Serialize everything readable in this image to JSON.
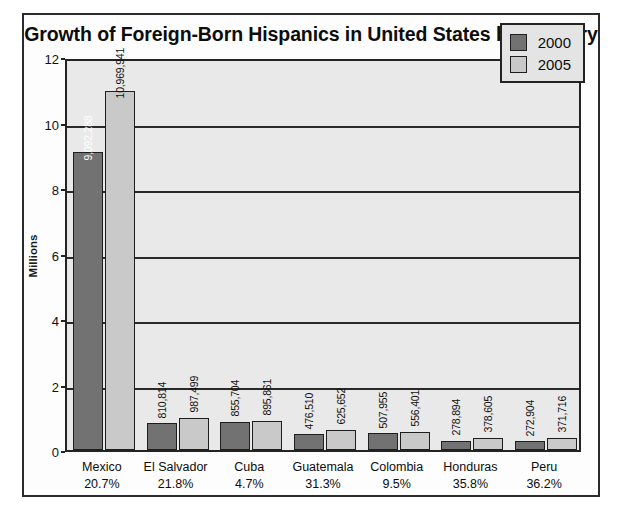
{
  "chart_data": {
    "type": "bar",
    "title": "Growth of Foreign-Born Hispanics in United States by Country",
    "xlabel": "",
    "ylabel": "Millions",
    "ylim": [
      0,
      12
    ],
    "yticks": [
      0,
      2,
      4,
      6,
      8,
      10,
      12
    ],
    "grid": true,
    "legend_position": "top-right",
    "categories": [
      "Mexico",
      "El Salvador",
      "Cuba",
      "Guatemala",
      "Colombia",
      "Honduras",
      "Peru"
    ],
    "category_percents": [
      "20.7%",
      "21.8%",
      "4.7%",
      "31.3%",
      "9.5%",
      "35.8%",
      "36.2%"
    ],
    "series": [
      {
        "name": "2000",
        "color": "#727272",
        "values": [
          9092288,
          810814,
          855704,
          476510,
          507955,
          278894,
          272904
        ],
        "labels": [
          "9,092,288",
          "810,814",
          "855,704",
          "476,510",
          "507,955",
          "278,894",
          "272,904"
        ]
      },
      {
        "name": "2005",
        "color": "#c9c9c9",
        "values": [
          10969941,
          987499,
          895861,
          625652,
          556401,
          378605,
          371716
        ],
        "labels": [
          "10,969,941",
          "987,499",
          "895,861",
          "625,652",
          "556,401",
          "378,605",
          "371,716"
        ]
      }
    ]
  },
  "legend": {
    "items": [
      {
        "label": "2000"
      },
      {
        "label": "2005"
      }
    ]
  }
}
